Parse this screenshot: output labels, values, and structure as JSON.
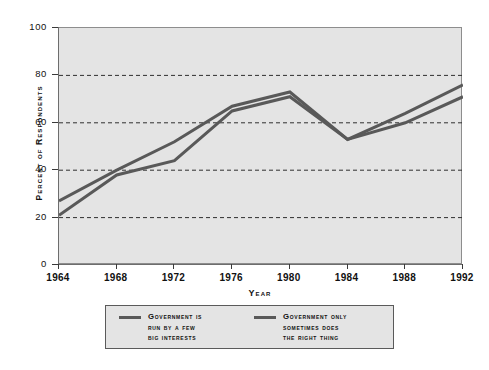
{
  "chart_data": {
    "type": "line",
    "title": "",
    "xlabel": "Year",
    "ylabel": "Percent of Respondents",
    "categories": [
      "1964",
      "1968",
      "1972",
      "1976",
      "1980",
      "1984",
      "1988",
      "1992"
    ],
    "x": [
      1964,
      1968,
      1972,
      1976,
      1980,
      1984,
      1988,
      1992
    ],
    "xlim": [
      1964,
      1992
    ],
    "ylim": [
      0,
      100
    ],
    "yticks": [
      "0",
      "20",
      "40",
      "60",
      "80",
      "100"
    ],
    "ytick_values": [
      0,
      20,
      40,
      60,
      80,
      100
    ],
    "grid": "horizontal-dashed",
    "gridlines": [
      20,
      40,
      60,
      80
    ],
    "legend_position": "below-axes",
    "series": [
      {
        "name": "Government is run by a few big interests",
        "legend_lines": [
          "Government is",
          "run by a few",
          "big interests"
        ],
        "color": "#595959",
        "values": [
          27,
          40,
          52,
          67,
          73,
          53,
          64,
          76
        ]
      },
      {
        "name": "Government only sometimes does the right thing",
        "legend_lines": [
          "Government only",
          "sometimes does",
          "the right thing"
        ],
        "color": "#595959",
        "values": [
          21,
          38,
          44,
          65,
          71,
          53,
          60,
          71
        ]
      }
    ]
  },
  "axes": {
    "ylabel": "Percent of Respondents",
    "xlabel": "Year",
    "ytick_labels": [
      "100",
      "80",
      "60",
      "40",
      "20",
      "0"
    ],
    "xtick_labels": [
      "1964",
      "1968",
      "1972",
      "1976",
      "1980",
      "1984",
      "1988",
      "1992"
    ]
  },
  "legend": {
    "entries": [
      {
        "line1": "Government is",
        "line2": "run by a few",
        "line3": "big interests"
      },
      {
        "line1": "Government only",
        "line2": "sometimes does",
        "line3": "the right thing"
      }
    ]
  },
  "colors": {
    "plot_background": "#e4e4e4",
    "page_background": "#ffffff",
    "line": "#595959",
    "axis": "#6d6d6d",
    "text": "#111111"
  }
}
